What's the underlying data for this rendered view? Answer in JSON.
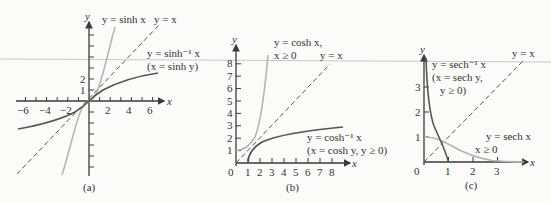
{
  "panels": [
    {
      "id": "a",
      "caption": "(a)",
      "axis_labels": {
        "x": "x",
        "y": "y"
      },
      "x_ticks": [
        "−6",
        "−4",
        "−2",
        "2",
        "4",
        "6"
      ],
      "y_ticks": [
        "2",
        "1"
      ],
      "labels": {
        "f": "y = sinh x",
        "identity": "y = x",
        "inverse": "y = sinh⁻¹ x",
        "inverse_def": "(x = sinh y)"
      }
    },
    {
      "id": "b",
      "caption": "(b)",
      "axis_labels": {
        "x": "x",
        "y": "y"
      },
      "origin": "0",
      "x_ticks": [
        "1",
        "2",
        "3",
        "4",
        "5",
        "6",
        "7",
        "8"
      ],
      "y_ticks": [
        "1",
        "2",
        "3",
        "4",
        "5",
        "6",
        "7",
        "8"
      ],
      "labels": {
        "f": "y = cosh x,",
        "f_domain": "x ≥ 0",
        "identity": "y = x",
        "inverse": "y = cosh⁻¹ x",
        "inverse_def": "(x = cosh y, y ≥ 0)"
      }
    },
    {
      "id": "c",
      "caption": "(c)",
      "axis_labels": {
        "x": "x",
        "y": "y"
      },
      "origin": "0",
      "x_ticks": [
        "1",
        "2",
        "3"
      ],
      "y_ticks": [
        "1",
        "2",
        "3"
      ],
      "labels": {
        "identity": "y = x",
        "inverse": "y = sech⁻¹ x",
        "inverse_def1": "(x = sech y,",
        "inverse_def2": "y ≥ 0)",
        "f": "y = sech x",
        "f_domain": "x ≥ 0"
      }
    }
  ],
  "colors": {
    "function_curve": "#b5b5b5",
    "inverse_curve": "#555555",
    "identity_line": "#555555",
    "axes": "#3a3a3a"
  }
}
